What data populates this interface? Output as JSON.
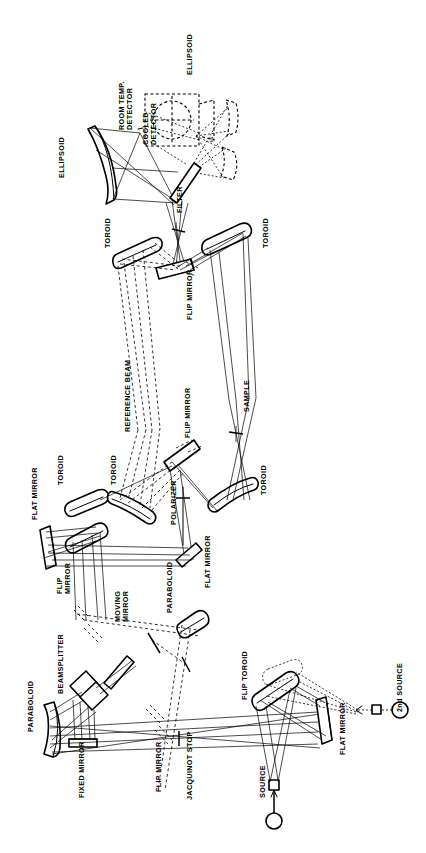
{
  "figure": {
    "type": "optical-schematic",
    "orientation": "rotated-90-ccw",
    "background_color": "#ffffff",
    "line_color": "#000000",
    "title": ""
  },
  "labels": [
    {
      "id": "ellipsoid-left",
      "text": "ELLIPSOID",
      "x": 58,
      "y": 178,
      "size": "normal"
    },
    {
      "id": "room-temp-detector",
      "text": "ROOM TEMP.\nDETECTOR",
      "x": 118,
      "y": 130,
      "size": "normal"
    },
    {
      "id": "cooled-detector",
      "text": "COOLED\nDETECTOR",
      "x": 142,
      "y": 145,
      "size": "normal"
    },
    {
      "id": "ellipsoid-right",
      "text": "ELLIPSOID",
      "x": 186,
      "y": 75,
      "size": "normal"
    },
    {
      "id": "f5-marker",
      "text": "f/5",
      "x": 210,
      "y": 142,
      "size": "tiny"
    },
    {
      "id": "filter",
      "text": "FILTER",
      "x": 176,
      "y": 213,
      "size": "normal"
    },
    {
      "id": "toroid-a",
      "text": "TOROID",
      "x": 104,
      "y": 248,
      "size": "normal"
    },
    {
      "id": "toroid-b",
      "text": "TOROID",
      "x": 262,
      "y": 248,
      "size": "normal"
    },
    {
      "id": "flip-mirror-filter",
      "text": "FLIP MIRROR",
      "x": 186,
      "y": 320,
      "size": "normal"
    },
    {
      "id": "reference-beam",
      "text": "REFERENCE BEAM",
      "x": 124,
      "y": 432,
      "size": "normal"
    },
    {
      "id": "flip-mirror-sample",
      "text": "FLIP MIRROR",
      "x": 184,
      "y": 438,
      "size": "normal"
    },
    {
      "id": "sample",
      "text": "SAMPLE",
      "x": 243,
      "y": 412,
      "size": "normal"
    },
    {
      "id": "toroid-c",
      "text": "TOROID",
      "x": 57,
      "y": 485,
      "size": "normal"
    },
    {
      "id": "toroid-d",
      "text": "TOROID",
      "x": 110,
      "y": 485,
      "size": "normal"
    },
    {
      "id": "toroid-e",
      "text": "TOROID",
      "x": 260,
      "y": 495,
      "size": "normal"
    },
    {
      "id": "polarizer",
      "text": "POLARIZER",
      "x": 170,
      "y": 525,
      "size": "normal"
    },
    {
      "id": "flat-mirror-a",
      "text": "FLAT MIRROR",
      "x": 31,
      "y": 520,
      "size": "normal"
    },
    {
      "id": "flat-mirror-b",
      "text": "FLAT MIRROR",
      "x": 204,
      "y": 588,
      "size": "normal"
    },
    {
      "id": "flip-mirror-bs",
      "text": "FLIP\nMIRROR",
      "x": 56,
      "y": 594,
      "size": "normal"
    },
    {
      "id": "moving-mirror",
      "text": "MOVING\nMIRROR",
      "x": 114,
      "y": 622,
      "size": "normal"
    },
    {
      "id": "paraboloid-b",
      "text": "PARABOLOID",
      "x": 166,
      "y": 613,
      "size": "normal"
    },
    {
      "id": "beamsplitter",
      "text": "BEAMSPLITTER",
      "x": 57,
      "y": 694,
      "size": "normal"
    },
    {
      "id": "paraboloid-a",
      "text": "PARABOLOID",
      "x": 27,
      "y": 732,
      "size": "normal"
    },
    {
      "id": "fixed-mirror",
      "text": "FIXED MIRROR",
      "x": 78,
      "y": 798,
      "size": "normal"
    },
    {
      "id": "flip-mirror-jac",
      "text": "FLIP MIRROR",
      "x": 155,
      "y": 792,
      "size": "normal"
    },
    {
      "id": "jacquinot-stop",
      "text": "JACQUINOT STOP",
      "x": 186,
      "y": 800,
      "size": "normal"
    },
    {
      "id": "source",
      "text": "SOURCE",
      "x": 259,
      "y": 798,
      "size": "normal"
    },
    {
      "id": "flip-toroid",
      "text": "FLIP TOROID",
      "x": 241,
      "y": 700,
      "size": "normal"
    },
    {
      "id": "flat-mirror-c",
      "text": "FLAT MIRROR",
      "x": 339,
      "y": 755,
      "size": "normal"
    },
    {
      "id": "second-source",
      "text": "2nd SOURCE",
      "x": 396,
      "y": 712,
      "size": "normal"
    }
  ],
  "components": [
    {
      "id": "ellipsoid-left",
      "kind": "curved-mirror",
      "label": "ELLIPSOID"
    },
    {
      "id": "ellipsoid-right",
      "kind": "curved-mirror",
      "label": "ELLIPSOID",
      "style": "dashed"
    },
    {
      "id": "room-temp-detector",
      "kind": "detector",
      "label": "ROOM TEMP. DETECTOR"
    },
    {
      "id": "cooled-detector",
      "kind": "dewar-detector",
      "label": "COOLED DETECTOR",
      "style": "dashed"
    },
    {
      "id": "filter",
      "kind": "filter",
      "label": "FILTER"
    },
    {
      "id": "flip-mirror-filter",
      "kind": "flat-mirror",
      "label": "FLIP MIRROR"
    },
    {
      "id": "toroid-a",
      "kind": "toroid-mirror",
      "label": "TOROID"
    },
    {
      "id": "toroid-b",
      "kind": "toroid-mirror",
      "label": "TOROID"
    },
    {
      "id": "toroid-c",
      "kind": "toroid-mirror",
      "label": "TOROID"
    },
    {
      "id": "toroid-d",
      "kind": "toroid-mirror",
      "label": "TOROID"
    },
    {
      "id": "toroid-e",
      "kind": "toroid-mirror",
      "label": "TOROID"
    },
    {
      "id": "polarizer",
      "kind": "polarizer",
      "label": "POLARIZER"
    },
    {
      "id": "sample",
      "kind": "sample",
      "label": "SAMPLE"
    },
    {
      "id": "flip-mirror-sample",
      "kind": "flat-mirror",
      "label": "FLIP MIRROR"
    },
    {
      "id": "flat-mirror-a",
      "kind": "flat-mirror",
      "label": "FLAT MIRROR"
    },
    {
      "id": "flat-mirror-b",
      "kind": "flat-mirror",
      "label": "FLAT MIRROR"
    },
    {
      "id": "flat-mirror-c",
      "kind": "flat-mirror",
      "label": "FLAT MIRROR"
    },
    {
      "id": "beamsplitter",
      "kind": "beamsplitter",
      "label": "BEAMSPLITTER"
    },
    {
      "id": "fixed-mirror",
      "kind": "flat-mirror",
      "label": "FIXED MIRROR"
    },
    {
      "id": "moving-mirror",
      "kind": "flat-mirror",
      "label": "MOVING MIRROR"
    },
    {
      "id": "paraboloid-a",
      "kind": "curved-mirror",
      "label": "PARABOLOID"
    },
    {
      "id": "paraboloid-b",
      "kind": "curved-mirror",
      "label": "PARABOLOID"
    },
    {
      "id": "jacquinot-stop",
      "kind": "aperture-stop",
      "label": "JACQUINOT STOP"
    },
    {
      "id": "flip-mirror-jac",
      "kind": "flat-mirror",
      "label": "FLIP MIRROR"
    },
    {
      "id": "flip-mirror-bs",
      "kind": "flat-mirror",
      "label": "FLIP MIRROR"
    },
    {
      "id": "flip-toroid",
      "kind": "toroid-mirror",
      "label": "FLIP TOROID"
    },
    {
      "id": "source",
      "kind": "light-source",
      "label": "SOURCE"
    },
    {
      "id": "second-source",
      "kind": "light-source",
      "label": "2nd SOURCE"
    },
    {
      "id": "reference-beam",
      "kind": "beam-path",
      "label": "REFERENCE BEAM",
      "style": "dashed"
    }
  ]
}
